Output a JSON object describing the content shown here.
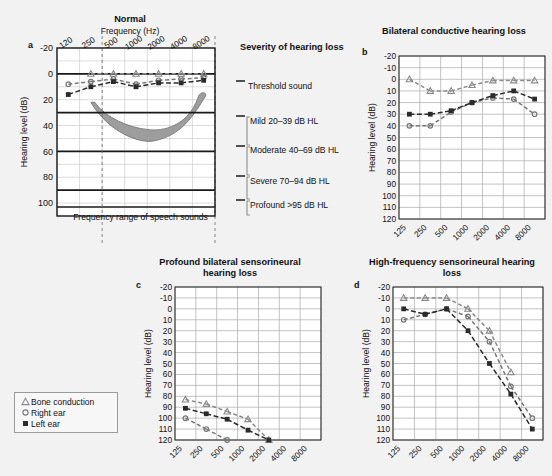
{
  "figure": {
    "background_color": "#f2f2f2",
    "plot_background": "#ffffff",
    "grid_color": "#9a9a9a",
    "bone_color": "#8a8a8a",
    "right_color": "#777777",
    "left_color": "#2b2b2b",
    "banana_fill": "#9d9d9d"
  },
  "legend": {
    "name": "audiogram-legend",
    "items": [
      {
        "marker": "triangle-marker",
        "label": "Bone conduction"
      },
      {
        "marker": "circle-marker",
        "label": "Right ear"
      },
      {
        "marker": "square-marker",
        "label": "Left  ear"
      }
    ]
  },
  "severity": {
    "heading": "Severity of hearing loss",
    "threshold_label": "Threshold sound",
    "bands": [
      {
        "label": "Mild 20–39 dB HL",
        "from": 20,
        "to": 39
      },
      {
        "label": "Moderate 40–69 dB HL",
        "from": 40,
        "to": 69
      },
      {
        "label": "Severe 70–94 dB HL",
        "from": 70,
        "to": 94
      },
      {
        "label": "Profound >95 dB HL",
        "from": 95,
        "to": 120
      }
    ]
  },
  "chart_data": [
    {
      "type": "line",
      "panel": "a",
      "title": "Normal",
      "xlabel": "Frequency (Hz)",
      "ylabel": "Hearing level  (dB)",
      "categories": [
        "120",
        "250",
        "500",
        "1000",
        "2000",
        "4000",
        "8000"
      ],
      "ytick_labels": [
        "-20",
        "0",
        "20",
        "40",
        "60",
        "80",
        "100"
      ],
      "ytick_values": [
        -20,
        0,
        20,
        40,
        60,
        80,
        100
      ],
      "ylim": [
        -20,
        110
      ],
      "grid": true,
      "annotation": "Frequency range of speech sounds",
      "speech_range": [
        "250",
        "8000"
      ],
      "series": [
        {
          "name": "Bone conduction",
          "marker": "triangle",
          "values": [
            null,
            0,
            0,
            0,
            0,
            0,
            0
          ]
        },
        {
          "name": "Right ear",
          "marker": "circle",
          "values": [
            8,
            6,
            4,
            8,
            5,
            4,
            3
          ]
        },
        {
          "name": "Left ear",
          "marker": "square",
          "values": [
            16,
            10,
            6,
            10,
            7,
            7,
            5
          ]
        }
      ],
      "speech_banana": "shaded region spanning 250-8000 Hz between about 20 and 50 dB HL"
    },
    {
      "type": "line",
      "panel": "b",
      "title": "Bilateral conductive hearing loss",
      "ylabel": "Hearing level  (dB)",
      "categories": [
        "125",
        "250",
        "500",
        "1000",
        "2000",
        "4000",
        "8000"
      ],
      "ytick_labels": [
        "-20",
        "-10",
        "0",
        "10",
        "20",
        "30",
        "40",
        "50",
        "60",
        "70",
        "80",
        "90",
        "100",
        "110",
        "120"
      ],
      "ytick_values": [
        -20,
        -10,
        0,
        10,
        20,
        30,
        40,
        50,
        60,
        70,
        80,
        90,
        100,
        110,
        120
      ],
      "ylim": [
        -20,
        120
      ],
      "grid": true,
      "series": [
        {
          "name": "Bone conduction",
          "marker": "triangle",
          "values": [
            0,
            10,
            10,
            5,
            1,
            1,
            1
          ]
        },
        {
          "name": "Right ear",
          "marker": "circle",
          "values": [
            40,
            40,
            28,
            20,
            16,
            17,
            30
          ]
        },
        {
          "name": "Left ear",
          "marker": "square",
          "values": [
            30,
            30,
            27,
            20,
            14,
            10,
            17
          ]
        }
      ]
    },
    {
      "type": "line",
      "panel": "c",
      "title": "Profound bilateral sensorineural hearing loss",
      "ylabel": "Hearing level  (dB)",
      "categories": [
        "125",
        "250",
        "500",
        "1000",
        "2000",
        "4000",
        "8000"
      ],
      "ytick_labels": [
        "-20",
        "-10",
        "0",
        "10",
        "20",
        "30",
        "40",
        "50",
        "60",
        "70",
        "80",
        "90",
        "100",
        "110",
        "120"
      ],
      "ytick_values": [
        -20,
        -10,
        0,
        10,
        20,
        30,
        40,
        50,
        60,
        70,
        80,
        90,
        100,
        110,
        120
      ],
      "ylim": [
        -20,
        120
      ],
      "grid": true,
      "series": [
        {
          "name": "Bone conduction",
          "marker": "triangle",
          "values": [
            83,
            87,
            94,
            101,
            120,
            null,
            null
          ]
        },
        {
          "name": "Right ear",
          "marker": "circle",
          "values": [
            100,
            110,
            120,
            null,
            null,
            null,
            null
          ]
        },
        {
          "name": "Left ear",
          "marker": "square",
          "values": [
            91,
            96,
            101,
            111,
            120,
            null,
            null
          ]
        }
      ]
    },
    {
      "type": "line",
      "panel": "d",
      "title": "High-frequency sensorineural hearing loss",
      "ylabel": "Hearing level  (dB)",
      "categories": [
        "125",
        "250",
        "500",
        "1000",
        "2000",
        "4000",
        "8000"
      ],
      "ytick_labels": [
        "-20",
        "-10",
        "0",
        "10",
        "20",
        "30",
        "40",
        "50",
        "60",
        "70",
        "80",
        "90",
        "100",
        "110",
        "120"
      ],
      "ytick_values": [
        -20,
        -10,
        0,
        10,
        20,
        30,
        40,
        50,
        60,
        70,
        80,
        90,
        100,
        110,
        120
      ],
      "ylim": [
        -20,
        120
      ],
      "grid": true,
      "series": [
        {
          "name": "Bone conduction",
          "marker": "triangle",
          "values": [
            -10,
            -10,
            -10,
            0,
            20,
            58,
            null
          ]
        },
        {
          "name": "Right ear",
          "marker": "circle",
          "values": [
            10,
            5,
            0,
            7,
            30,
            71,
            100
          ]
        },
        {
          "name": "Left ear",
          "marker": "square",
          "values": [
            0,
            5,
            0,
            20,
            50,
            78,
            110
          ]
        }
      ]
    }
  ]
}
